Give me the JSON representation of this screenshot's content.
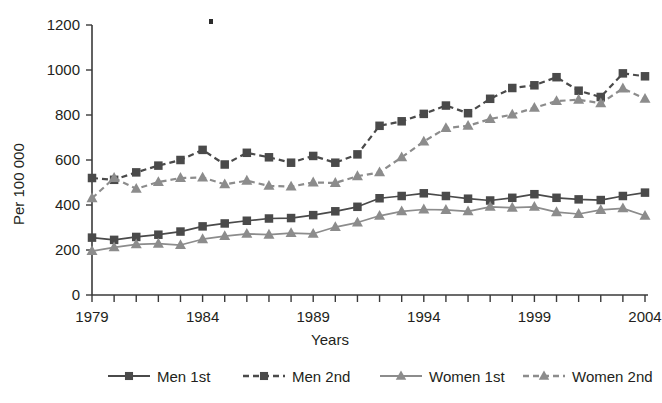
{
  "chart_data": {
    "type": "line",
    "title": "",
    "xlabel": "Years",
    "ylabel": "Per 100 000",
    "xlim": [
      1979,
      2004
    ],
    "ylim": [
      0,
      1200
    ],
    "ytick_step": 200,
    "yticks": [
      0,
      200,
      400,
      600,
      800,
      1000,
      1200
    ],
    "ytick_labels": [
      "0",
      "200",
      "400",
      "600",
      "800",
      "1000",
      "1200"
    ],
    "xticks": [
      1979,
      1980,
      1981,
      1982,
      1983,
      1984,
      1985,
      1986,
      1987,
      1988,
      1989,
      1990,
      1991,
      1992,
      1993,
      1994,
      1995,
      1996,
      1997,
      1998,
      1999,
      2000,
      2001,
      2002,
      2003,
      2004
    ],
    "xtick_labels_shown": [
      "1979",
      "1984",
      "1989",
      "1994",
      "1999",
      "2004"
    ],
    "grid": false,
    "legend_position": "bottom",
    "x": [
      1979,
      1980,
      1981,
      1982,
      1983,
      1984,
      1985,
      1986,
      1987,
      1988,
      1989,
      1990,
      1991,
      1992,
      1993,
      1994,
      1995,
      1996,
      1997,
      1998,
      1999,
      2000,
      2001,
      2002,
      2003,
      2004
    ],
    "series": [
      {
        "name": "Men 1st",
        "marker": "square",
        "linestyle": "solid",
        "color": "#4a4a4a",
        "values": [
          255,
          245,
          258,
          268,
          282,
          305,
          318,
          330,
          340,
          342,
          355,
          372,
          392,
          430,
          440,
          452,
          440,
          428,
          420,
          432,
          448,
          432,
          425,
          422,
          440,
          455
        ]
      },
      {
        "name": "Men 2nd",
        "marker": "square",
        "linestyle": "dashed",
        "color": "#4a4a4a",
        "values": [
          520,
          512,
          545,
          575,
          600,
          645,
          580,
          632,
          612,
          588,
          618,
          588,
          625,
          752,
          772,
          805,
          842,
          808,
          872,
          920,
          932,
          968,
          908,
          880,
          985,
          972
        ]
      },
      {
        "name": "Women 1st",
        "marker": "triangle",
        "linestyle": "solid",
        "color": "#8c8c8c",
        "values": [
          195,
          212,
          225,
          228,
          222,
          248,
          262,
          272,
          268,
          275,
          272,
          302,
          322,
          352,
          372,
          380,
          378,
          372,
          392,
          388,
          392,
          368,
          360,
          378,
          385,
          352
        ]
      },
      {
        "name": "Women 2nd",
        "marker": "triangle",
        "linestyle": "dashed",
        "color": "#8c8c8c",
        "values": [
          430,
          520,
          472,
          502,
          520,
          522,
          492,
          508,
          485,
          482,
          500,
          498,
          528,
          545,
          612,
          682,
          742,
          752,
          782,
          802,
          832,
          862,
          868,
          852,
          918,
          872
        ]
      }
    ]
  },
  "legend": {
    "items": [
      {
        "label": "Men 1st",
        "marker": "square",
        "style": "solid",
        "color": "#4a4a4a"
      },
      {
        "label": "Men 2nd",
        "marker": "square",
        "style": "dashed",
        "color": "#4a4a4a"
      },
      {
        "label": "Women 1st",
        "marker": "triangle",
        "style": "solid",
        "color": "#8c8c8c"
      },
      {
        "label": "Women 2nd",
        "marker": "triangle",
        "style": "dashed",
        "color": "#8c8c8c"
      }
    ]
  },
  "colors": {
    "men": "#4a4a4a",
    "women": "#8c8c8c",
    "axis": "#3a3a3a",
    "text": "#231f20",
    "background": "#ffffff"
  }
}
